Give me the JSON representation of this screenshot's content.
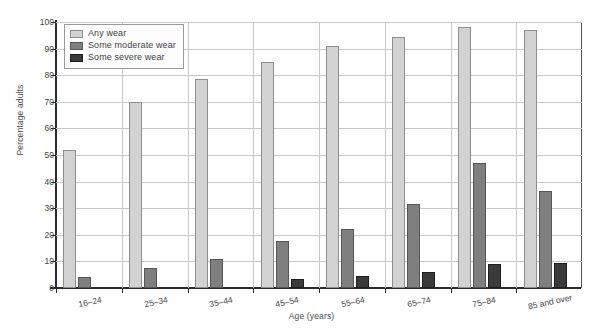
{
  "chart_data": {
    "type": "bar",
    "title": "",
    "xlabel": "Age (years)",
    "ylabel": "Percentage adults",
    "categories": [
      "16–24",
      "25–34",
      "35–44",
      "45–54",
      "55–64",
      "65–74",
      "75–84",
      "85 and over"
    ],
    "series": [
      {
        "name": "Any wear",
        "color": "#d2d2d2",
        "values": [
          52,
          70,
          78.5,
          85,
          91,
          94.5,
          98,
          97
        ]
      },
      {
        "name": "Some moderate wear",
        "color": "#7f7f7f",
        "values": [
          4,
          7.5,
          11,
          17.5,
          22,
          31.5,
          47,
          36.5
        ]
      },
      {
        "name": "Some severe wear",
        "color": "#3a3a3a",
        "values": [
          0,
          0,
          0,
          3.5,
          4.5,
          6,
          9,
          9.5
        ]
      }
    ],
    "ylim": [
      0,
      100
    ],
    "yticks": [
      0,
      10,
      20,
      30,
      40,
      50,
      60,
      70,
      80,
      90,
      100
    ],
    "grid": true,
    "legend_position": "upper-left"
  },
  "axes": {
    "y_label": "Percentage adults",
    "x_label": "Age (years)"
  }
}
